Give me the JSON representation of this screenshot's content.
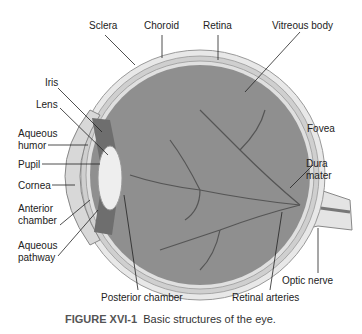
{
  "figure": {
    "caption_label": "FIGURE XVI-1",
    "caption_text": "Basic structures of the eye."
  },
  "labels": {
    "sclera": "Sclera",
    "choroid": "Choroid",
    "retina": "Retina",
    "vitreous_body": "Vitreous body",
    "iris": "Iris",
    "lens": "Lens",
    "aqueous_humor_1": "Aqueous",
    "aqueous_humor_2": "humor",
    "pupil": "Pupil",
    "cornea": "Cornea",
    "anterior_chamber_1": "Anterior",
    "anterior_chamber_2": "chamber",
    "aqueous_pathway_1": "Aqueous",
    "aqueous_pathway_2": "pathway",
    "fovea": "Fovea",
    "dura_mater_1": "Dura",
    "dura_mater_2": "mater",
    "optic_nerve": "Optic nerve",
    "posterior_chamber": "Posterior chamber",
    "retinal_arteries": "Retinal arteries"
  }
}
